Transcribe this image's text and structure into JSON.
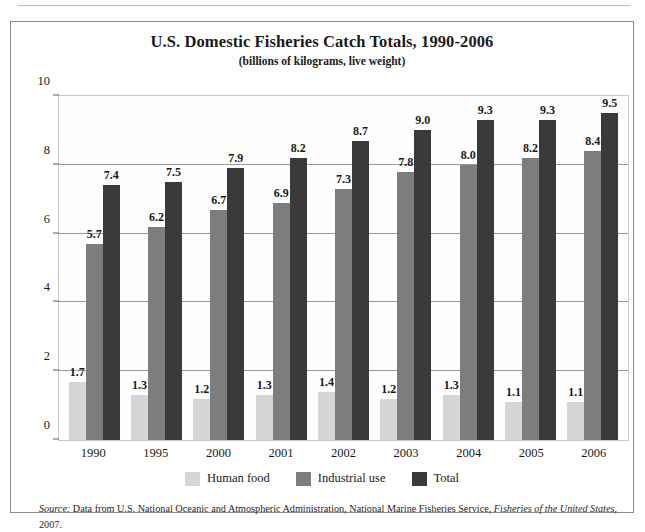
{
  "chart_data": {
    "type": "bar",
    "title": "U.S. Domestic Fisheries Catch Totals, 1990-2006",
    "subtitle": "(billions of kilograms, live weight)",
    "xlabel": "",
    "ylabel": "",
    "ylim": [
      0,
      10
    ],
    "yticks": [
      0,
      2,
      4,
      6,
      8,
      10
    ],
    "grid": true,
    "legend_position": "bottom",
    "categories": [
      "1990",
      "1995",
      "2000",
      "2001",
      "2002",
      "2003",
      "2004",
      "2005",
      "2006"
    ],
    "series": [
      {
        "name": "Human food",
        "color": "#d6d6d6",
        "values": [
          1.7,
          1.3,
          1.2,
          1.3,
          1.4,
          1.2,
          1.3,
          1.1,
          1.1
        ],
        "labels": [
          "1.7",
          "1.3",
          "1.2",
          "1.3",
          "1.4",
          "1.2",
          "1.3",
          "1.1",
          "1.1"
        ]
      },
      {
        "name": "Industrial use",
        "color": "#7d7d7d",
        "values": [
          5.7,
          6.2,
          6.7,
          6.9,
          7.3,
          7.8,
          8.0,
          8.2,
          8.4
        ],
        "labels": [
          "5.7",
          "6.2",
          "6.7",
          "6.9",
          "7.3",
          "7.8",
          "8.0",
          "8.2",
          "8.4"
        ]
      },
      {
        "name": "Total",
        "color": "#3a3a3a",
        "values": [
          7.4,
          7.5,
          7.9,
          8.2,
          8.7,
          9.0,
          9.3,
          9.3,
          9.5
        ],
        "labels": [
          "7.4",
          "7.5",
          "7.9",
          "8.2",
          "8.7",
          "9.0",
          "9.3",
          "9.3",
          "9.5"
        ]
      }
    ]
  },
  "source": {
    "lead": "Source:",
    "line1": " Data from U.S. National Oceanic and Atmospheric Administration, National Marine Fisheries Service, ",
    "publication": "Fisheries of the United States",
    "line2": ", 2007."
  }
}
